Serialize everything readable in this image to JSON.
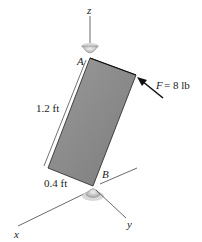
{
  "figure": {
    "axes": {
      "z": "z",
      "x": "x",
      "y": "y"
    },
    "points": {
      "A": "A",
      "B": "B"
    },
    "dimensions": {
      "length": "1.2 ft",
      "width": "0.4 ft"
    },
    "force": {
      "symbol": "F",
      "value": "= 8 lb"
    },
    "colors": {
      "plate": "#8a8a8a",
      "line": "#333333",
      "bearing": "#bdbdbd"
    }
  }
}
